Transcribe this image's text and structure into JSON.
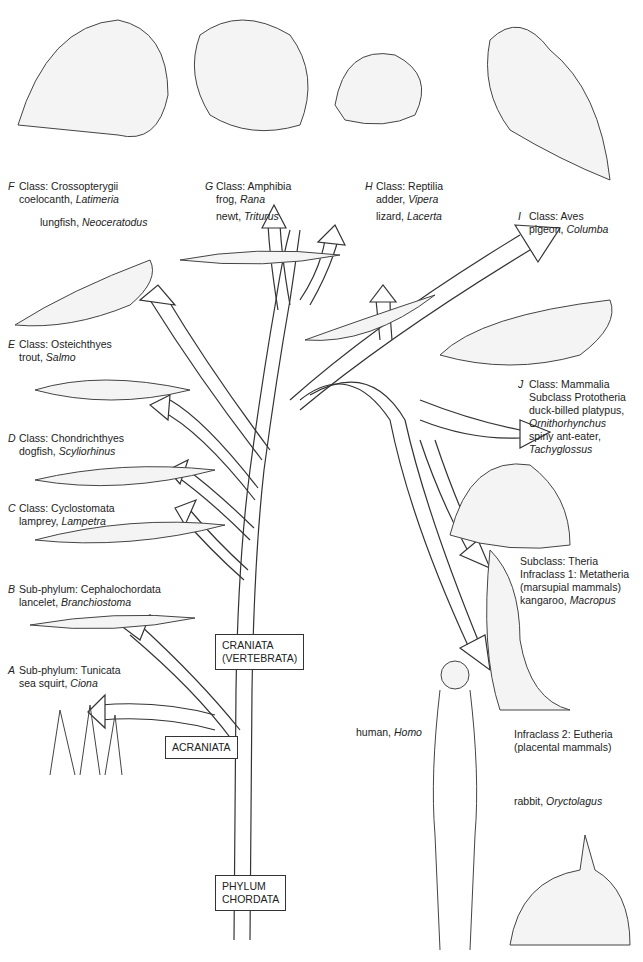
{
  "diagram": {
    "title_boxes": {
      "phylum": [
        "PHYLUM",
        "CHORDATA"
      ],
      "acraniata": "ACRANIATA",
      "craniata": [
        "CRANIATA",
        "(VERTEBRATA)"
      ]
    },
    "groups": [
      {
        "letter": "A",
        "rank": "Sub-phylum: Tunicata",
        "examples": [
          {
            "common": "sea squirt, ",
            "genus": "Ciona"
          }
        ]
      },
      {
        "letter": "B",
        "rank": "Sub-phylum: Cephalochordata",
        "examples": [
          {
            "common": "lancelet, ",
            "genus": "Branchiostoma"
          }
        ]
      },
      {
        "letter": "C",
        "rank": "Class: Cyclostomata",
        "examples": [
          {
            "common": "lamprey, ",
            "genus": "Lampetra"
          }
        ]
      },
      {
        "letter": "D",
        "rank": "Class: Chondrichthyes",
        "examples": [
          {
            "common": "dogfish, ",
            "genus": "Scyliorhinus"
          }
        ]
      },
      {
        "letter": "E",
        "rank": "Class: Osteichthyes",
        "examples": [
          {
            "common": "trout, ",
            "genus": "Salmo"
          }
        ]
      },
      {
        "letter": "F",
        "rank": "Class: Crossopterygii",
        "examples": [
          {
            "common": "coelocanth, ",
            "genus": "Latimeria"
          },
          {
            "common": "lungfish, ",
            "genus": "Neoceratodus"
          }
        ]
      },
      {
        "letter": "G",
        "rank": "Class: Amphibia",
        "examples": [
          {
            "common": "frog, ",
            "genus": "Rana"
          },
          {
            "common": "newt, ",
            "genus": "Triturus"
          }
        ]
      },
      {
        "letter": "H",
        "rank": "Class: Reptilia",
        "examples": [
          {
            "common": "adder, ",
            "genus": "Vipera"
          },
          {
            "common": "lizard, ",
            "genus": "Lacerta"
          }
        ]
      },
      {
        "letter": "I",
        "rank": "Class: Aves",
        "examples": [
          {
            "common": "pigeon, ",
            "genus": "Columba"
          }
        ]
      },
      {
        "letter": "J",
        "rank": "Class: Mammalia",
        "sub": "Subclass  Prototheria",
        "examples": [
          {
            "common": "duck-billed platypus,",
            "genus": "Ornithorhynchus"
          },
          {
            "common": "spiny ant-eater,",
            "genus": "Tachyglossus"
          }
        ]
      }
    ],
    "theria": {
      "subclass": "Subclass: Theria",
      "infra1": "Infraclass 1: Metatheria",
      "infra1_note": "(marsupial mammals)",
      "kangaroo": {
        "common": "kangaroo, ",
        "genus": "Macropus"
      },
      "infra2": "Infraclass 2: Eutheria",
      "infra2_note": "(placental mammals)",
      "human": {
        "common": "human, ",
        "genus": "Homo"
      },
      "rabbit": {
        "common": "rabbit, ",
        "genus": "Oryctolagus"
      }
    }
  }
}
